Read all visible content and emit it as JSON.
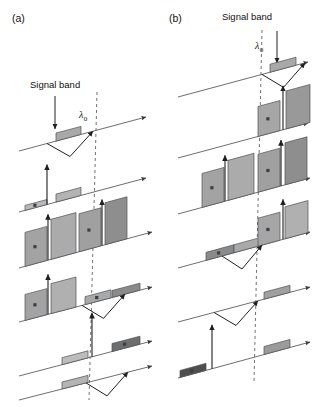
{
  "figure": {
    "width": 314,
    "height": 407,
    "background": "#ffffff",
    "line_color": "#55585c",
    "axis_color": "#6b6e72",
    "dashed_color": "#6e7175",
    "arrow_color": "#202020"
  },
  "panels": [
    {
      "id": "a",
      "label": "(a)",
      "label_x": 12,
      "label_y": 22,
      "signal_band_label": "Signal band",
      "signal_label_x": 30,
      "signal_label_y": 88,
      "lambda_label": "λ",
      "lambda_sub": "0",
      "lambda_x": 79,
      "lambda_y": 118,
      "dashed_x_top": 97,
      "dashed_x_bottom": 89,
      "dashed_y_top": 92,
      "dashed_y_bottom": 400,
      "signal_arrow": {
        "x1": 55,
        "y1": 96,
        "x2": 55,
        "y2": 129
      },
      "axes": [
        {
          "x1": 19,
          "y1": 151,
          "x2": 146,
          "y2": 117
        },
        {
          "x1": 19,
          "y1": 212,
          "x2": 146,
          "y2": 178
        },
        {
          "x1": 19,
          "y1": 268,
          "x2": 152,
          "y2": 232
        },
        {
          "x1": 19,
          "y1": 322,
          "x2": 152,
          "y2": 287
        },
        {
          "x1": 19,
          "y1": 376,
          "x2": 152,
          "y2": 341
        },
        {
          "x1": 19,
          "y1": 400,
          "x2": 152,
          "y2": 366
        }
      ],
      "rows": [
        {
          "stage": 1,
          "bands": [
            {
              "x": 56,
              "w": 25,
              "h": 8,
              "fill": "#a9a9a9",
              "mark": false
            }
          ],
          "up_arrows": [],
          "v_arrows": [
            {
              "from_x": 47,
              "to_x": 93
            }
          ]
        },
        {
          "stage": 2,
          "bands": [
            {
              "x": 25,
              "w": 22,
              "h": 5,
              "fill": "#b8b8b8",
              "mark": true
            },
            {
              "x": 56,
              "w": 25,
              "h": 8,
              "fill": "#b4b4b4",
              "mark": false
            }
          ],
          "up_arrows": [
            {
              "x": 47,
              "len": 40
            }
          ],
          "v_arrows": []
        },
        {
          "stage": 3,
          "bands": [
            {
              "x": 25,
              "w": 22,
              "h": 34,
              "fill": "#a3a3a3",
              "mark": true
            },
            {
              "x": 51,
              "w": 25,
              "h": 40,
              "fill": "#ababab",
              "mark": false
            },
            {
              "x": 79,
              "w": 22,
              "h": 38,
              "fill": "#a0a0a0",
              "mark": true
            },
            {
              "x": 105,
              "w": 22,
              "h": 42,
              "fill": "#8e8e8e",
              "mark": false
            }
          ],
          "up_arrows": [
            {
              "x": 48,
              "len": 46
            },
            {
              "x": 102,
              "len": 46
            }
          ],
          "v_arrows": []
        },
        {
          "stage": 4,
          "bands": [
            {
              "x": 25,
              "w": 22,
              "h": 26,
              "fill": "#a3a3a3",
              "mark": true
            },
            {
              "x": 51,
              "w": 25,
              "h": 30,
              "fill": "#b0b0b0",
              "mark": false
            },
            {
              "x": 85,
              "w": 26,
              "h": 8,
              "fill": "#a9a9a9",
              "mark": true
            },
            {
              "x": 112,
              "w": 28,
              "h": 7,
              "fill": "#8a8a8a",
              "mark": false
            }
          ],
          "up_arrows": [
            {
              "x": 48,
              "len": 40
            }
          ],
          "v_arrows": [
            {
              "from_x": 82,
              "to_x": 125
            }
          ]
        },
        {
          "stage": 5,
          "bands": [
            {
              "x": 62,
              "w": 26,
              "h": 7,
              "fill": "#bcbcbc",
              "mark": false
            },
            {
              "x": 112,
              "w": 28,
              "h": 8,
              "fill": "#6e6e6e",
              "mark": true
            }
          ],
          "up_arrows": [
            {
              "x": 92,
              "len": 44
            }
          ],
          "v_arrows": []
        },
        {
          "stage": 6,
          "bands": [
            {
              "x": 62,
              "w": 26,
              "h": 7,
              "fill": "#b4b4b4",
              "mark": false
            }
          ],
          "up_arrows": [],
          "v_arrows": [
            {
              "from_x": 86,
              "to_x": 128
            }
          ]
        }
      ]
    },
    {
      "id": "b",
      "label": "(b)",
      "label_x": 169,
      "label_y": 22,
      "signal_band_label": "Signal band",
      "signal_label_x": 247,
      "signal_label_y": 20,
      "lambda_label": "λ",
      "lambda_sub": "0",
      "lambda_x": 255,
      "lambda_y": 49,
      "dashed_x_top": 262,
      "dashed_x_bottom": 254,
      "dashed_y_top": 30,
      "dashed_y_bottom": 382,
      "signal_arrow": {
        "x1": 277,
        "y1": 31,
        "x2": 277,
        "y2": 63
      },
      "axes": [
        {
          "x1": 178,
          "y1": 97,
          "x2": 308,
          "y2": 62
        },
        {
          "x1": 178,
          "y1": 158,
          "x2": 308,
          "y2": 123
        },
        {
          "x1": 178,
          "y1": 214,
          "x2": 310,
          "y2": 178
        },
        {
          "x1": 178,
          "y1": 268,
          "x2": 310,
          "y2": 232
        },
        {
          "x1": 178,
          "y1": 322,
          "x2": 310,
          "y2": 287
        },
        {
          "x1": 178,
          "y1": 378,
          "x2": 310,
          "y2": 342
        }
      ],
      "rows": [
        {
          "stage": 1,
          "bands": [
            {
              "x": 270,
              "w": 26,
              "h": 8,
              "fill": "#a9a9a9",
              "mark": false
            }
          ],
          "up_arrows": [],
          "v_arrows": [
            {
              "from_x": 262,
              "to_x": 305
            }
          ]
        },
        {
          "stage": 2,
          "bands": [
            {
              "x": 258,
              "w": 22,
              "h": 30,
              "fill": "#a6a6a6",
              "mark": true
            },
            {
              "x": 286,
              "w": 24,
              "h": 38,
              "fill": "#999999",
              "mark": false
            }
          ],
          "up_arrows": [
            {
              "x": 283,
              "len": 44
            }
          ],
          "v_arrows": []
        },
        {
          "stage": 3,
          "bands": [
            {
              "x": 202,
              "w": 22,
              "h": 34,
              "fill": "#a3a3a3",
              "mark": true
            },
            {
              "x": 228,
              "w": 26,
              "h": 40,
              "fill": "#ababab",
              "mark": false
            },
            {
              "x": 258,
              "w": 22,
              "h": 38,
              "fill": "#a0a0a0",
              "mark": true
            },
            {
              "x": 285,
              "w": 22,
              "h": 42,
              "fill": "#8e8e8e",
              "mark": false
            }
          ],
          "up_arrows": [
            {
              "x": 225,
              "len": 46
            },
            {
              "x": 281,
              "len": 46
            }
          ],
          "v_arrows": []
        },
        {
          "stage": 4,
          "bands": [
            {
              "x": 206,
              "w": 28,
              "h": 8,
              "fill": "#8a8a8a",
              "mark": true
            },
            {
              "x": 234,
              "w": 26,
              "h": 8,
              "fill": "#a9a9a9",
              "mark": false
            },
            {
              "x": 258,
              "w": 22,
              "h": 28,
              "fill": "#a6a6a6",
              "mark": true
            },
            {
              "x": 285,
              "w": 23,
              "h": 32,
              "fill": "#b0b0b0",
              "mark": false
            }
          ],
          "up_arrows": [
            {
              "x": 283,
              "len": 40
            }
          ],
          "v_arrows": [
            {
              "from_x": 222,
              "to_x": 262
            }
          ]
        },
        {
          "stage": 5,
          "bands": [
            {
              "x": 264,
              "w": 26,
              "h": 7,
              "fill": "#a0a0a0",
              "mark": false
            }
          ],
          "up_arrows": [],
          "v_arrows": [
            {
              "from_x": 214,
              "to_x": 258
            }
          ]
        },
        {
          "stage": 6,
          "bands": [
            {
              "x": 180,
              "w": 26,
              "h": 7,
              "fill": "#4e4e4e",
              "mark": true
            },
            {
              "x": 264,
              "w": 26,
              "h": 8,
              "fill": "#9b9b9b",
              "mark": false
            }
          ],
          "up_arrows": [
            {
              "x": 212,
              "len": 44
            }
          ],
          "v_arrows": []
        }
      ]
    }
  ]
}
